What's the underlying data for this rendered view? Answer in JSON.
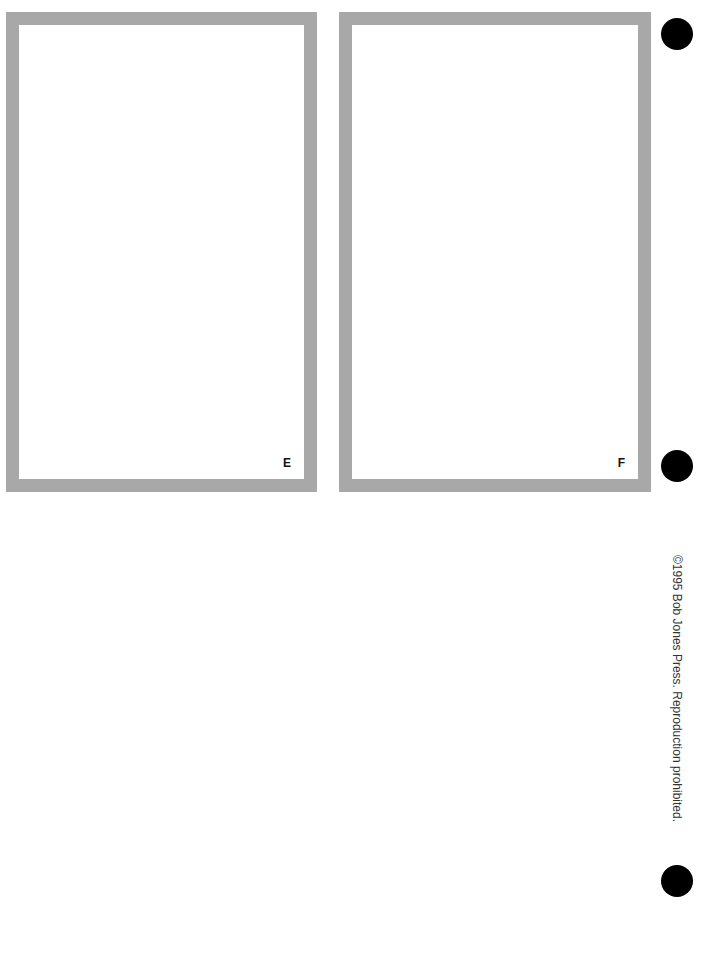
{
  "frames": [
    {
      "label": "E",
      "border_color": "#a8a8a8"
    },
    {
      "label": "F",
      "border_color": "#a8a8a8"
    }
  ],
  "punch_holes": [
    "hole",
    "hole",
    "hole"
  ],
  "copyright": "©1995 Bob Jones Press. Reproduction prohibited."
}
